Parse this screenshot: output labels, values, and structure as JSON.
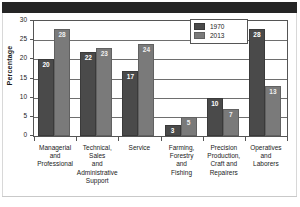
{
  "topbar": {
    "present": true
  },
  "chart_data": {
    "type": "bar",
    "title": "",
    "xlabel": "",
    "ylabel": "Percentage",
    "ylim": [
      0,
      30
    ],
    "yticks": [
      0,
      5,
      10,
      15,
      20,
      25,
      30
    ],
    "grid": true,
    "legend_position": "top-right",
    "categories": [
      "Managerial and Professional",
      "Technical, Sales and Administrative Support",
      "Service",
      "Farming, Forestry and Fishing",
      "Precision Production, Craft and Repairers",
      "Operatives and Laborers"
    ],
    "category_lines": [
      [
        "Managerial",
        "and",
        "Professional"
      ],
      [
        "Technical,",
        "Sales",
        "and",
        "Administrative",
        "Support"
      ],
      [
        "Service"
      ],
      [
        "Farming,",
        "Forestry",
        "and",
        "Fishing"
      ],
      [
        "Precision",
        "Production,",
        "Craft and",
        "Repairers"
      ],
      [
        "Operatives",
        "and",
        "Laborers"
      ]
    ],
    "series": [
      {
        "name": "1970",
        "color": "#4a4a4a",
        "values": [
          20,
          22,
          17,
          3,
          10,
          28
        ]
      },
      {
        "name": "2013",
        "color": "#7a7a7a",
        "values": [
          28,
          23,
          24,
          5,
          7,
          13
        ]
      }
    ]
  }
}
